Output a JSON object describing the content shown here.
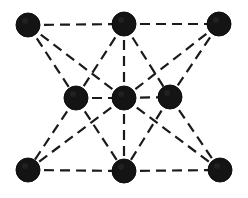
{
  "diagram": {
    "type": "lattice-structure",
    "colors": {
      "node": "#141414",
      "edge": "#1a1a1a",
      "background": "#ffffff"
    },
    "node_radius": 12,
    "nodes": [
      {
        "id": "TL",
        "x": 28,
        "y": 25
      },
      {
        "id": "TM",
        "x": 124,
        "y": 24
      },
      {
        "id": "TR",
        "x": 219,
        "y": 24
      },
      {
        "id": "ML",
        "x": 76,
        "y": 98
      },
      {
        "id": "MC",
        "x": 124,
        "y": 98
      },
      {
        "id": "MR",
        "x": 170,
        "y": 97
      },
      {
        "id": "BL",
        "x": 28,
        "y": 170
      },
      {
        "id": "BM",
        "x": 124,
        "y": 171
      },
      {
        "id": "BR",
        "x": 220,
        "y": 170
      }
    ],
    "edges": [
      [
        "TL",
        "TM"
      ],
      [
        "TM",
        "TR"
      ],
      [
        "BL",
        "BM"
      ],
      [
        "BM",
        "BR"
      ],
      [
        "ML",
        "MC"
      ],
      [
        "MC",
        "MR"
      ],
      [
        "TL",
        "ML"
      ],
      [
        "TL",
        "MC"
      ],
      [
        "TM",
        "ML"
      ],
      [
        "TM",
        "MC"
      ],
      [
        "TM",
        "MR"
      ],
      [
        "TR",
        "MR"
      ],
      [
        "TR",
        "MC"
      ],
      [
        "ML",
        "BL"
      ],
      [
        "ML",
        "BM"
      ],
      [
        "MC",
        "BM"
      ],
      [
        "MC",
        "BR"
      ],
      [
        "MC",
        "BL"
      ],
      [
        "MR",
        "BM"
      ],
      [
        "MR",
        "BR"
      ]
    ]
  }
}
